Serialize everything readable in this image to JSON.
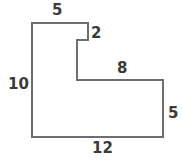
{
  "figure": {
    "type": "geometry-diagram",
    "stroke_color": "#6e6e6e",
    "fill_color": "#ffffff",
    "label_color": "#3a3a3a",
    "stroke_width": 2,
    "viewbox": {
      "width": 182,
      "height": 163
    },
    "polygon_points": "32,23 88,23 88,40 77,40 77,80 163,80 163,137 32,137",
    "labels": {
      "top": "5",
      "notch": "2",
      "middle": "8",
      "left": "10",
      "right": "5",
      "bottom": "12"
    }
  }
}
